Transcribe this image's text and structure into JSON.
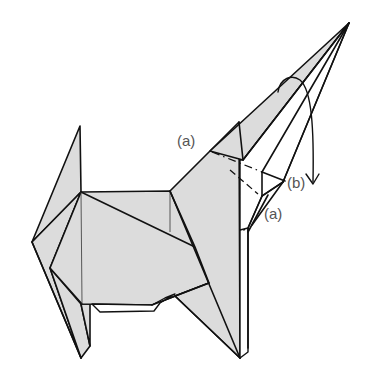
{
  "diagram": {
    "labels": {
      "a_top": "(a)",
      "b_right": "(b)",
      "a_bottom": "(a)"
    },
    "colors": {
      "paper_fill": "#dcdcdc",
      "stroke": "#111111",
      "label_text": "#555555",
      "background": "#ffffff"
    },
    "fold_lines": {
      "valley": "dashed",
      "mountain": "dash-dot"
    },
    "arrows": [
      {
        "name": "fold-down-arrow",
        "description": "curved arrow from snout folding downward"
      }
    ]
  }
}
